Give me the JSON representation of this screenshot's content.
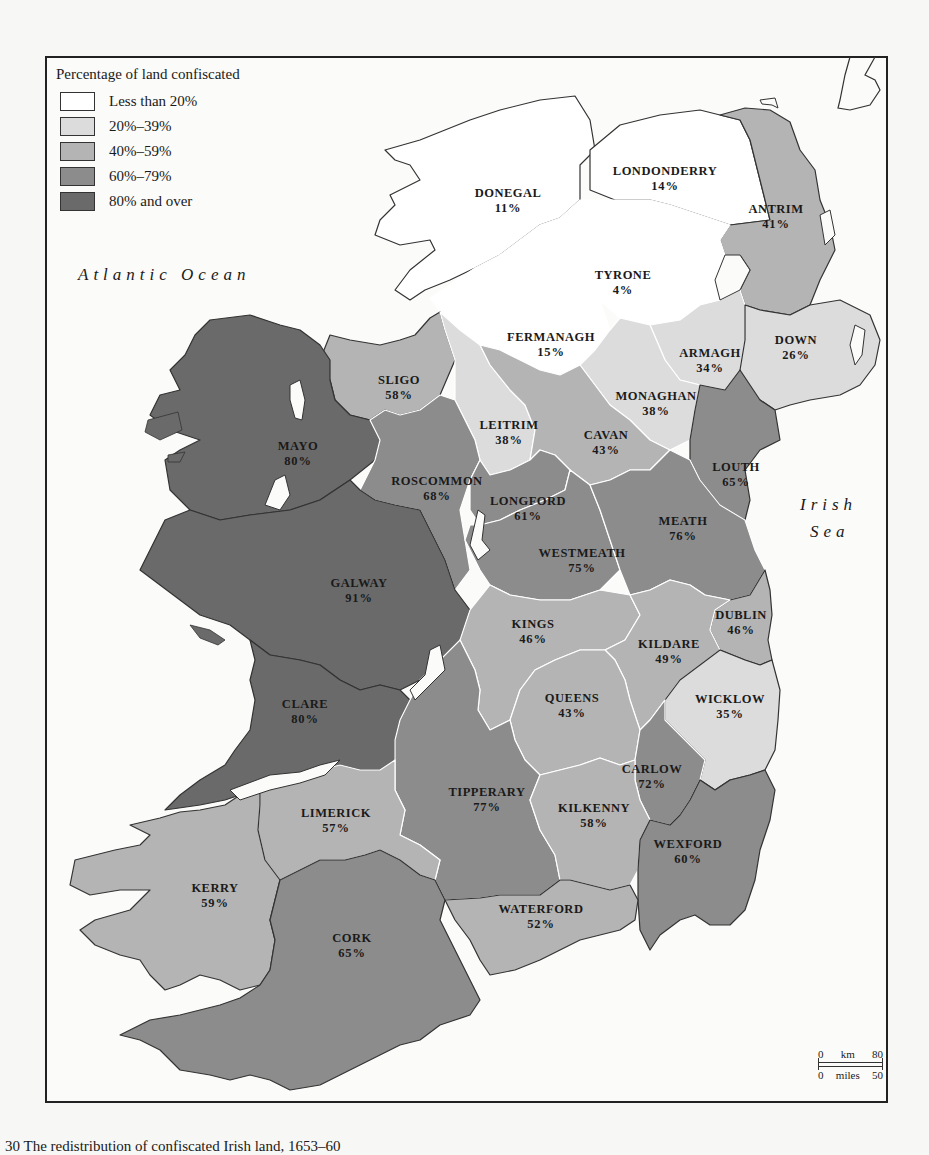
{
  "legend": {
    "title": "Percentage of land confiscated",
    "items": [
      {
        "label": "Less than 20%",
        "color": "#ffffff"
      },
      {
        "label": "20%–39%",
        "color": "#dcdcdc"
      },
      {
        "label": "40%–59%",
        "color": "#b4b4b4"
      },
      {
        "label": "60%–79%",
        "color": "#8c8c8c"
      },
      {
        "label": "80% and over",
        "color": "#6a6a6a"
      }
    ]
  },
  "seas": {
    "atlantic": "Atlantic Ocean",
    "irish_line1": "Irish",
    "irish_line2": "Sea"
  },
  "counties": [
    {
      "name": "DONEGAL",
      "pct": "11%",
      "value": 11
    },
    {
      "name": "LONDONDERRY",
      "pct": "14%",
      "value": 14
    },
    {
      "name": "ANTRIM",
      "pct": "41%",
      "value": 41
    },
    {
      "name": "TYRONE",
      "pct": "4%",
      "value": 4
    },
    {
      "name": "FERMANAGH",
      "pct": "15%",
      "value": 15
    },
    {
      "name": "ARMAGH",
      "pct": "34%",
      "value": 34
    },
    {
      "name": "DOWN",
      "pct": "26%",
      "value": 26
    },
    {
      "name": "SLIGO",
      "pct": "58%",
      "value": 58
    },
    {
      "name": "MONAGHAN",
      "pct": "38%",
      "value": 38
    },
    {
      "name": "LEITRIM",
      "pct": "38%",
      "value": 38
    },
    {
      "name": "MAYO",
      "pct": "80%",
      "value": 80
    },
    {
      "name": "CAVAN",
      "pct": "43%",
      "value": 43
    },
    {
      "name": "LOUTH",
      "pct": "65%",
      "value": 65
    },
    {
      "name": "ROSCOMMON",
      "pct": "68%",
      "value": 68
    },
    {
      "name": "LONGFORD",
      "pct": "61%",
      "value": 61
    },
    {
      "name": "MEATH",
      "pct": "76%",
      "value": 76
    },
    {
      "name": "WESTMEATH",
      "pct": "75%",
      "value": 75
    },
    {
      "name": "GALWAY",
      "pct": "91%",
      "value": 91
    },
    {
      "name": "KINGS",
      "pct": "46%",
      "value": 46
    },
    {
      "name": "DUBLIN",
      "pct": "46%",
      "value": 46
    },
    {
      "name": "KILDARE",
      "pct": "49%",
      "value": 49
    },
    {
      "name": "QUEENS",
      "pct": "43%",
      "value": 43
    },
    {
      "name": "WICKLOW",
      "pct": "35%",
      "value": 35
    },
    {
      "name": "CLARE",
      "pct": "80%",
      "value": 80
    },
    {
      "name": "CARLOW",
      "pct": "72%",
      "value": 72
    },
    {
      "name": "TIPPERARY",
      "pct": "77%",
      "value": 77
    },
    {
      "name": "LIMERICK",
      "pct": "57%",
      "value": 57
    },
    {
      "name": "KILKENNY",
      "pct": "58%",
      "value": 58
    },
    {
      "name": "WEXFORD",
      "pct": "60%",
      "value": 60
    },
    {
      "name": "KERRY",
      "pct": "59%",
      "value": 59
    },
    {
      "name": "WATERFORD",
      "pct": "52%",
      "value": 52
    },
    {
      "name": "CORK",
      "pct": "65%",
      "value": 65
    }
  ],
  "scale": {
    "km_start": "0",
    "km_unit": "km",
    "km_end": "80",
    "mi_start": "0",
    "mi_unit": "miles",
    "mi_end": "50"
  },
  "caption": "30 The redistribution of confiscated Irish land, 1653–60"
}
